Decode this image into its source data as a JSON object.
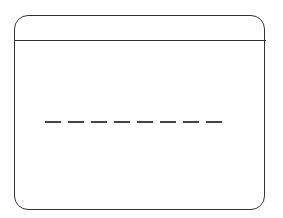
{
  "window": {
    "title_bar_text": "",
    "content_placeholder": {
      "type": "dashed-line",
      "dash_count": 8,
      "color": "#444444"
    },
    "border_color": "#333333"
  }
}
